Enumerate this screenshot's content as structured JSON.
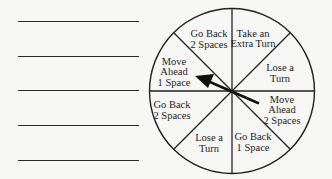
{
  "answer_lines": {
    "count": 5,
    "y_positions": [
      22,
      57,
      91,
      126,
      161
    ]
  },
  "spinner": {
    "center": [
      232,
      91
    ],
    "radius": 83,
    "sections": [
      {
        "position": "top-left",
        "line1": "Go Back",
        "line2": "2 Spaces",
        "line3": ""
      },
      {
        "position": "top-right",
        "line1": "Take an",
        "line2": "Extra Turn",
        "line3": ""
      },
      {
        "position": "right-upper",
        "line1": "Lose a",
        "line2": "Turn",
        "line3": ""
      },
      {
        "position": "right-lower",
        "line1": "Move",
        "line2": "Ahead",
        "line3": "2 Spaces"
      },
      {
        "position": "bottom-right",
        "line1": "Go Back",
        "line2": "1 Space",
        "line3": ""
      },
      {
        "position": "bottom-left",
        "line1": "Lose a",
        "line2": "Turn",
        "line3": ""
      },
      {
        "position": "left-lower",
        "line1": "Go Back",
        "line2": "2 Spaces",
        "line3": ""
      },
      {
        "position": "left-upper",
        "line1": "Move",
        "line2": "Ahead",
        "line3": "1 Space"
      }
    ],
    "arrow": {
      "points_to": "Move Ahead 1 Space"
    }
  }
}
